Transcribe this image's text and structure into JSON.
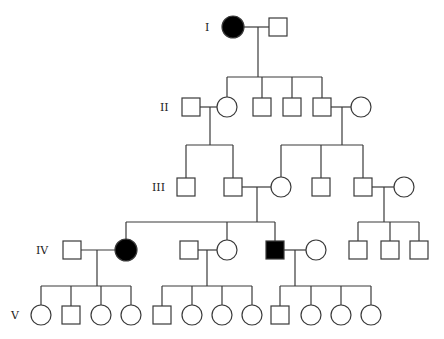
{
  "colors": {
    "line": "#3a3a3a",
    "affected": "#000000",
    "unaffected": "#ffffff"
  },
  "generations": [
    {
      "label": "I",
      "label_x": 205,
      "y": 27
    },
    {
      "label": "II",
      "label_x": 160,
      "y": 107
    },
    {
      "label": "III",
      "label_x": 152,
      "y": 187
    },
    {
      "label": "IV",
      "label_x": 36,
      "y": 250
    },
    {
      "label": "V",
      "label_x": 11,
      "y": 315
    }
  ],
  "individuals": [
    {
      "id": "I-1",
      "gen": 0,
      "sex": "female",
      "affected": true,
      "x": 233
    },
    {
      "id": "I-2",
      "gen": 0,
      "sex": "male",
      "affected": false,
      "x": 278
    },
    {
      "id": "II-1",
      "gen": 1,
      "sex": "male",
      "affected": false,
      "x": 191
    },
    {
      "id": "II-2",
      "gen": 1,
      "sex": "female",
      "affected": false,
      "x": 227
    },
    {
      "id": "II-3",
      "gen": 1,
      "sex": "male",
      "affected": false,
      "x": 262
    },
    {
      "id": "II-4",
      "gen": 1,
      "sex": "male",
      "affected": false,
      "x": 292
    },
    {
      "id": "II-5",
      "gen": 1,
      "sex": "male",
      "affected": false,
      "x": 322
    },
    {
      "id": "II-6",
      "gen": 1,
      "sex": "female",
      "affected": false,
      "x": 361
    },
    {
      "id": "III-1",
      "gen": 2,
      "sex": "male",
      "affected": false,
      "x": 186
    },
    {
      "id": "III-2",
      "gen": 2,
      "sex": "male",
      "affected": false,
      "x": 233
    },
    {
      "id": "III-3",
      "gen": 2,
      "sex": "female",
      "affected": false,
      "x": 281
    },
    {
      "id": "III-4",
      "gen": 2,
      "sex": "male",
      "affected": false,
      "x": 321
    },
    {
      "id": "III-5",
      "gen": 2,
      "sex": "male",
      "affected": false,
      "x": 363
    },
    {
      "id": "III-6",
      "gen": 2,
      "sex": "female",
      "affected": false,
      "x": 404
    },
    {
      "id": "IV-1",
      "gen": 3,
      "sex": "male",
      "affected": false,
      "x": 72
    },
    {
      "id": "IV-2",
      "gen": 3,
      "sex": "female",
      "affected": true,
      "x": 126
    },
    {
      "id": "IV-3",
      "gen": 3,
      "sex": "male",
      "affected": false,
      "x": 189
    },
    {
      "id": "IV-4",
      "gen": 3,
      "sex": "female",
      "affected": false,
      "x": 227
    },
    {
      "id": "IV-5",
      "gen": 3,
      "sex": "male",
      "affected": true,
      "x": 275
    },
    {
      "id": "IV-6",
      "gen": 3,
      "sex": "female",
      "affected": false,
      "x": 316
    },
    {
      "id": "IV-7",
      "gen": 3,
      "sex": "male",
      "affected": false,
      "x": 358
    },
    {
      "id": "IV-8",
      "gen": 3,
      "sex": "male",
      "affected": false,
      "x": 390
    },
    {
      "id": "IV-9",
      "gen": 3,
      "sex": "male",
      "affected": false,
      "x": 419
    },
    {
      "id": "V-1",
      "gen": 4,
      "sex": "female",
      "affected": false,
      "x": 41
    },
    {
      "id": "V-2",
      "gen": 4,
      "sex": "male",
      "affected": false,
      "x": 71
    },
    {
      "id": "V-3",
      "gen": 4,
      "sex": "female",
      "affected": false,
      "x": 101
    },
    {
      "id": "V-4",
      "gen": 4,
      "sex": "female",
      "affected": false,
      "x": 131
    },
    {
      "id": "V-5",
      "gen": 4,
      "sex": "male",
      "affected": false,
      "x": 162
    },
    {
      "id": "V-6",
      "gen": 4,
      "sex": "female",
      "affected": false,
      "x": 192
    },
    {
      "id": "V-7",
      "gen": 4,
      "sex": "female",
      "affected": false,
      "x": 222
    },
    {
      "id": "V-8",
      "gen": 4,
      "sex": "female",
      "affected": false,
      "x": 252
    },
    {
      "id": "V-9",
      "gen": 4,
      "sex": "male",
      "affected": false,
      "x": 280
    },
    {
      "id": "V-10",
      "gen": 4,
      "sex": "female",
      "affected": false,
      "x": 311
    },
    {
      "id": "V-11",
      "gen": 4,
      "sex": "female",
      "affected": false,
      "x": 341
    },
    {
      "id": "V-12",
      "gen": 4,
      "sex": "female",
      "affected": false,
      "x": 371
    }
  ],
  "families": [
    {
      "parents": [
        "I-1",
        "I-2"
      ],
      "drop_x": 258,
      "sib_y": 77,
      "children": [
        "II-2",
        "II-3",
        "II-4",
        "II-5"
      ]
    },
    {
      "parents": [
        "II-1",
        "II-2"
      ],
      "drop_x": 210,
      "sib_y": 145,
      "children": [
        "III-1",
        "III-2"
      ]
    },
    {
      "parents": [
        "II-5",
        "II-6"
      ],
      "drop_x": 342,
      "sib_y": 145,
      "children": [
        "III-3",
        "III-4",
        "III-5"
      ]
    },
    {
      "parents": [
        "III-2",
        "III-3"
      ],
      "drop_x": 257,
      "sib_y": 222,
      "children": [
        "IV-2",
        "IV-4",
        "IV-5"
      ]
    },
    {
      "parents": [
        "III-5",
        "III-6"
      ],
      "drop_x": 384,
      "sib_y": 222,
      "children": [
        "IV-7",
        "IV-8",
        "IV-9"
      ]
    },
    {
      "parents": [
        "IV-1",
        "IV-2"
      ],
      "drop_x": 97,
      "sib_y": 286,
      "children": [
        "V-1",
        "V-2",
        "V-3",
        "V-4"
      ]
    },
    {
      "parents": [
        "IV-3",
        "IV-4"
      ],
      "drop_x": 207,
      "sib_y": 286,
      "children": [
        "V-5",
        "V-6",
        "V-7",
        "V-8"
      ]
    },
    {
      "parents": [
        "IV-5",
        "IV-6"
      ],
      "drop_x": 295,
      "sib_y": 286,
      "children": [
        "V-9",
        "V-10",
        "V-11",
        "V-12"
      ]
    }
  ],
  "symbol_size": {
    "square": 18,
    "circle_r": 10,
    "affected_circle_r": 11
  }
}
